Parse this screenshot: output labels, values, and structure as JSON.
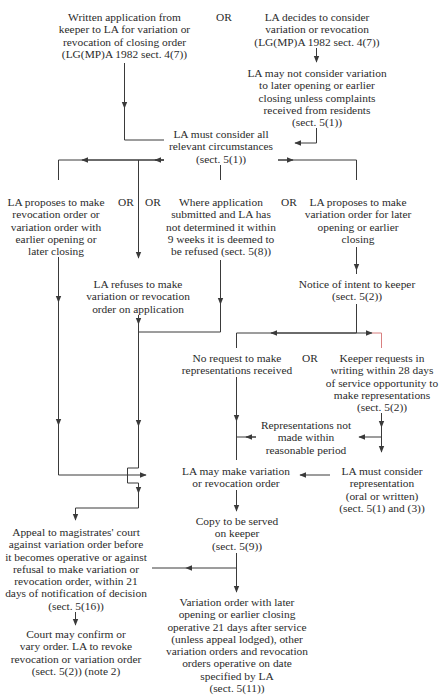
{
  "diagram": {
    "type": "flowchart",
    "colors": {
      "line": "#3a3a3a",
      "text": "#2b2b2b",
      "accent_red": "#d9534f"
    },
    "connector_label": "OR",
    "nodes": {
      "written_application": "Written application from\nkeeper to LA for variation or\nrevocation of closing order\n(LG(MP)A 1982 sect. 4(7))",
      "la_decides": "LA decides to consider\nvariation or revocation\n(LG(MP)A 1982 sect. 4(7))",
      "la_may_not": "LA may not consider variation\nto later opening or earlier\nclosing unless complaints\nreceived from residents\n(sect. 5(1))",
      "la_must_consider_all": "LA must consider all\nrelevant circumstances\n(sect. 5(1))",
      "la_proposes_revocation": "LA proposes to make\nrevocation order or\nvariation order with\nearlier opening or\nlater closing",
      "deemed_refused": "Where application\nsubmitted and LA has\nnot determined it within\n9 weeks it is deemed to\nbe refused (sect. 5(8))",
      "la_proposes_variation": "LA proposes to make\nvariation order for later\nopening or earlier\nclosing",
      "la_refuses": "LA refuses to make\nvariation or revocation\norder on application",
      "notice_of_intent": "Notice of intent to keeper\n(sect. 5(2))",
      "no_request": "No request to make\nrepresentations received",
      "keeper_requests": "Keeper requests in\nwriting within 28 days\nof service opportunity to\nmake representations\n(sect. 5(2))",
      "representations_not_made": "Representations not\nmade within\nreasonable period",
      "la_may_make": "LA may make variation\nor revocation order",
      "la_must_consider_representation": "LA must consider\nrepresentation\n(oral or written)\n(sect. 5(1) and (3))",
      "copy_served": "Copy to be served\non keeper\n(sect. 5(9))",
      "appeal": "Appeal to magistrates' court\nagainst variation order before\nit becomes operative or against\nrefusal to make variation or\nrevocation order, within 21\ndays of notification of decision\n(sect. 5(16))",
      "court_may_confirm": "Court may confirm or\nvary order. LA to revoke\nrevocation or variation order\n(sect. 5(2)) (note 2)",
      "variation_operative": "Variation order with later\nopening or earlier closing\noperative 21 days after service\n(unless appeal lodged), other\nvariation orders and revocation\norders operative on date\nspecified by LA\n(sect. 5(11))"
    }
  }
}
